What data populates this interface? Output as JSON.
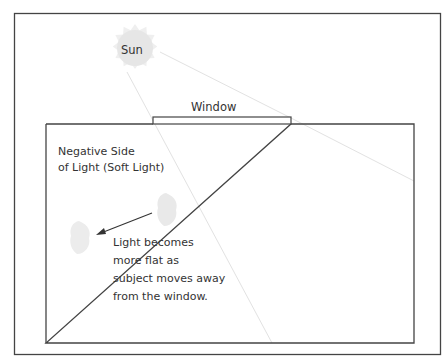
{
  "diagram": {
    "sun": {
      "label": "Sun"
    },
    "window": {
      "label": "Window"
    },
    "negative_side": {
      "line1": "Negative Side",
      "line2": "of Light (Soft Light)"
    },
    "note": {
      "line1": "Light becomes",
      "line2": "more flat as",
      "line3": "subject moves away",
      "line4": "from the window."
    },
    "colors": {
      "border": "#444444",
      "sun_fill": "#e6e6e6",
      "sun_rays": "#eeeeee",
      "light_rays": "#e2e2e2",
      "subject": "#e9e9e9",
      "text": "#333333"
    }
  }
}
